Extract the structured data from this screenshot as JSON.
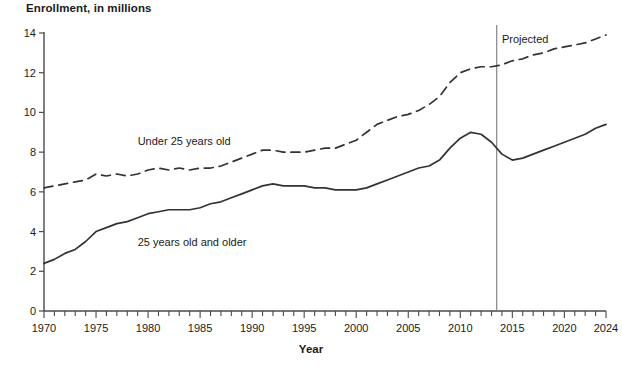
{
  "chart_data": {
    "type": "line",
    "title": "Enrollment, in millions",
    "xlabel": "Year",
    "ylabel": "",
    "xlim": [
      1970,
      2024
    ],
    "ylim": [
      0,
      14
    ],
    "ytick_step": 2,
    "yticks": [
      0,
      2,
      4,
      6,
      8,
      10,
      12,
      14
    ],
    "xticks": [
      1970,
      1975,
      1980,
      1985,
      1990,
      1995,
      2000,
      2005,
      2010,
      2015,
      2020,
      2024
    ],
    "xtick_labels": [
      "1970",
      "1975",
      "1980",
      "1985",
      "1990",
      "1995",
      "2000",
      "2005",
      "2010",
      "2015",
      "2020",
      "2024"
    ],
    "ytick_labels": [
      "0",
      "2",
      "4",
      "6",
      "8",
      "10",
      "12",
      "14"
    ],
    "grid": false,
    "legend_position": "inline-annotation",
    "x": [
      1970,
      1971,
      1972,
      1973,
      1974,
      1975,
      1976,
      1977,
      1978,
      1979,
      1980,
      1981,
      1982,
      1983,
      1984,
      1985,
      1986,
      1987,
      1988,
      1989,
      1990,
      1991,
      1992,
      1993,
      1994,
      1995,
      1996,
      1997,
      1998,
      1999,
      2000,
      2001,
      2002,
      2003,
      2004,
      2005,
      2006,
      2007,
      2008,
      2009,
      2010,
      2011,
      2012,
      2013,
      2014,
      2015,
      2016,
      2017,
      2018,
      2019,
      2020,
      2021,
      2022,
      2023,
      2024
    ],
    "series": [
      {
        "name": "Under 25 years old",
        "style": "dashed",
        "color": "#333333",
        "values": [
          6.2,
          6.3,
          6.4,
          6.5,
          6.6,
          6.9,
          6.8,
          6.9,
          6.8,
          6.9,
          7.1,
          7.2,
          7.1,
          7.2,
          7.1,
          7.2,
          7.2,
          7.3,
          7.5,
          7.7,
          7.9,
          8.1,
          8.1,
          8.0,
          8.0,
          8.0,
          8.1,
          8.2,
          8.2,
          8.4,
          8.6,
          9.0,
          9.4,
          9.6,
          9.8,
          9.9,
          10.1,
          10.4,
          10.8,
          11.5,
          12.0,
          12.2,
          12.3,
          12.3,
          12.4,
          12.6,
          12.7,
          12.9,
          13.0,
          13.2,
          13.3,
          13.4,
          13.5,
          13.7,
          13.9
        ]
      },
      {
        "name": "25 years old and older",
        "style": "solid",
        "color": "#333333",
        "values": [
          2.4,
          2.6,
          2.9,
          3.1,
          3.5,
          4.0,
          4.2,
          4.4,
          4.5,
          4.7,
          4.9,
          5.0,
          5.1,
          5.1,
          5.1,
          5.2,
          5.4,
          5.5,
          5.7,
          5.9,
          6.1,
          6.3,
          6.4,
          6.3,
          6.3,
          6.3,
          6.2,
          6.2,
          6.1,
          6.1,
          6.1,
          6.2,
          6.4,
          6.6,
          6.8,
          7.0,
          7.2,
          7.3,
          7.6,
          8.2,
          8.7,
          9.0,
          8.9,
          8.5,
          7.9,
          7.6,
          7.7,
          7.9,
          8.1,
          8.3,
          8.5,
          8.7,
          8.9,
          9.2,
          9.4
        ]
      }
    ],
    "annotations": [
      {
        "text": "Projected",
        "x": 2014.0,
        "y": 13.5,
        "name": "projected-label"
      },
      {
        "text": "Under 25 years old",
        "x": 1979.0,
        "y": 8.35,
        "name": "under-25-series-label"
      },
      {
        "text": "25 years old and older",
        "x": 1979.0,
        "y": 3.25,
        "name": "older-25-series-label"
      }
    ],
    "reference_lines": [
      {
        "orientation": "vertical",
        "x": 2013.5,
        "label": "Projected",
        "color": "#7a7a7a"
      }
    ]
  }
}
